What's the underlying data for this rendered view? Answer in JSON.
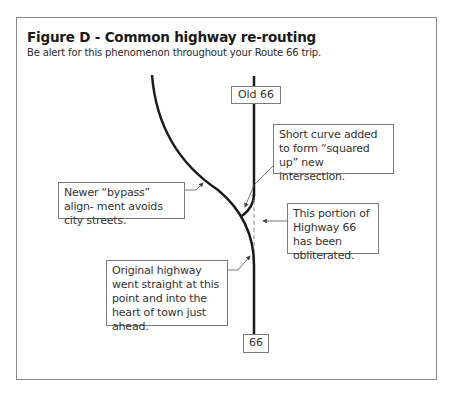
{
  "figure": {
    "title": "Figure D - Common highway re-routing",
    "subtitle": "Be alert for this phenomenon throughout your Route 66 trip."
  },
  "signs": {
    "top": "Old 66",
    "bottom": "66"
  },
  "callouts": {
    "short_curve": "Short curve added to form “squared up” new intersection.",
    "bypass": "Newer “bypass” align- ment avoids city streets.",
    "obliterated": "This portion of Highway 66 has been obliterated.",
    "original": "Original highway went straight at this point and into the heart of town just ahead."
  },
  "colors": {
    "road": "#1a1a1a",
    "border": "#8a8a8a",
    "leader": "#555555"
  }
}
